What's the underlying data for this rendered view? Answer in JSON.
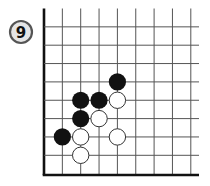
{
  "problem": {
    "number": "9",
    "badge_fill": "#e6e6e6",
    "badge_stroke": "#555555"
  },
  "board": {
    "origin_x": 44,
    "origin_y": 8.5,
    "spacing": 18.35,
    "columns": 9,
    "rows": 9,
    "right_extent": 199,
    "bottom_edge_y": 175,
    "line_color": "#555555",
    "edge_color": "#111111",
    "edges": [
      "left",
      "bottom"
    ]
  },
  "stones": [
    {
      "color": "black",
      "col": 4,
      "row": 4
    },
    {
      "color": "black",
      "col": 2,
      "row": 5
    },
    {
      "color": "black",
      "col": 3,
      "row": 5
    },
    {
      "color": "white",
      "col": 4,
      "row": 5
    },
    {
      "color": "black",
      "col": 2,
      "row": 6
    },
    {
      "color": "white",
      "col": 3,
      "row": 6
    },
    {
      "color": "black",
      "col": 1,
      "row": 7
    },
    {
      "color": "white",
      "col": 2,
      "row": 7
    },
    {
      "color": "white",
      "col": 4,
      "row": 7
    },
    {
      "color": "white",
      "col": 2,
      "row": 8
    }
  ],
  "colors": {
    "black_stone": "#111111",
    "white_stone": "#ffffff",
    "white_stone_outline": "#333333"
  }
}
